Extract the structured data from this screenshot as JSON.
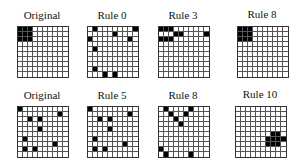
{
  "figure": {
    "grid_size": 10,
    "panels": [
      {
        "id": "top-original",
        "label": "Original",
        "x": 17,
        "y": 26,
        "filled": [
          [
            0,
            0
          ],
          [
            0,
            1
          ],
          [
            0,
            2
          ],
          [
            1,
            0
          ],
          [
            1,
            1
          ],
          [
            1,
            2
          ],
          [
            2,
            0
          ],
          [
            2,
            1
          ],
          [
            2,
            2
          ]
        ]
      },
      {
        "id": "top-rule0",
        "label": "Rule 0",
        "x": 87,
        "y": 26,
        "filled": [
          [
            0,
            1
          ],
          [
            0,
            9
          ],
          [
            1,
            5
          ],
          [
            2,
            0
          ],
          [
            2,
            8
          ],
          [
            4,
            1
          ],
          [
            8,
            1
          ],
          [
            9,
            3
          ],
          [
            9,
            5
          ]
        ]
      },
      {
        "id": "top-rule3",
        "label": "Rule 3",
        "x": 158,
        "y": 26,
        "filled": [
          [
            0,
            0
          ],
          [
            0,
            1
          ],
          [
            0,
            2
          ],
          [
            1,
            3
          ],
          [
            1,
            4
          ],
          [
            1,
            9
          ],
          [
            2,
            0
          ],
          [
            2,
            1
          ],
          [
            2,
            2
          ]
        ]
      },
      {
        "id": "top-rule8",
        "label": "Rule 8",
        "x": 237,
        "y": 26,
        "filled": [
          [
            0,
            0
          ],
          [
            0,
            1
          ],
          [
            0,
            2
          ],
          [
            1,
            0
          ],
          [
            1,
            1
          ],
          [
            1,
            2
          ],
          [
            2,
            0
          ],
          [
            2,
            1
          ],
          [
            2,
            2
          ]
        ]
      },
      {
        "id": "bottom-original",
        "label": "Original",
        "x": 17,
        "y": 106,
        "filled": [
          [
            0,
            0
          ],
          [
            1,
            8
          ],
          [
            2,
            2
          ],
          [
            2,
            4
          ],
          [
            4,
            4
          ],
          [
            6,
            1
          ],
          [
            7,
            7
          ],
          [
            8,
            1
          ],
          [
            8,
            3
          ]
        ]
      },
      {
        "id": "bottom-rule5",
        "label": "Rule 5",
        "x": 87,
        "y": 106,
        "filled": [
          [
            0,
            0
          ],
          [
            1,
            8
          ],
          [
            2,
            2
          ],
          [
            2,
            4
          ],
          [
            4,
            4
          ],
          [
            6,
            1
          ],
          [
            7,
            7
          ],
          [
            8,
            1
          ],
          [
            8,
            3
          ]
        ]
      },
      {
        "id": "bottom-rule8",
        "label": "Rule 8",
        "x": 158,
        "y": 106,
        "filled": [
          [
            0,
            1
          ],
          [
            0,
            6
          ],
          [
            1,
            2
          ],
          [
            1,
            5
          ],
          [
            2,
            3
          ],
          [
            3,
            4
          ],
          [
            8,
            0
          ],
          [
            9,
            1
          ],
          [
            9,
            6
          ]
        ]
      },
      {
        "id": "bottom-rule10",
        "label": "Rule 10",
        "x": 235,
        "y": 106,
        "filled": [
          [
            5,
            7
          ],
          [
            5,
            8
          ],
          [
            6,
            6
          ],
          [
            6,
            7
          ],
          [
            6,
            8
          ],
          [
            6,
            9
          ],
          [
            7,
            6
          ],
          [
            7,
            7
          ],
          [
            7,
            8
          ]
        ]
      }
    ]
  },
  "labels": {
    "top": [
      "Original",
      "Rule 0",
      "Rule 3",
      "Rule 8"
    ],
    "bottom": [
      "Original",
      "Rule 5",
      "Rule 8",
      "Rule 10"
    ]
  }
}
